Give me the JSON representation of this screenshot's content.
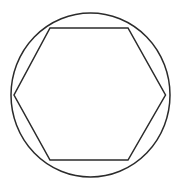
{
  "document": {
    "title": "Inscribed hexagon in circle",
    "background_color": "#ffffff",
    "width": 181,
    "height": 187
  },
  "figure": {
    "name": "circle-with-inscribed-hexagon",
    "stroke_color": "#2b2b2b",
    "stroke_width": 1.5,
    "fill": "none"
  },
  "chart_data": {
    "type": "diagram",
    "shapes": [
      {
        "name": "circle",
        "type": "ellipse",
        "center": [
          90.5,
          95
        ],
        "radius_x": 79.5,
        "radius_y": 82,
        "stroke": "#2b2b2b",
        "stroke_width": 1.5,
        "fill": "none"
      },
      {
        "name": "hexagon",
        "type": "polygon",
        "sides": 6,
        "vertices": [
          [
            50,
            28
          ],
          [
            128,
            28
          ],
          [
            165.5,
            95
          ],
          [
            128,
            160
          ],
          [
            50,
            160
          ],
          [
            14,
            95
          ]
        ],
        "stroke": "#2b2b2b",
        "stroke_width": 1.5,
        "fill": "none"
      }
    ],
    "xlabel": "",
    "ylabel": "",
    "grid": false,
    "legend": false,
    "annotations": []
  }
}
